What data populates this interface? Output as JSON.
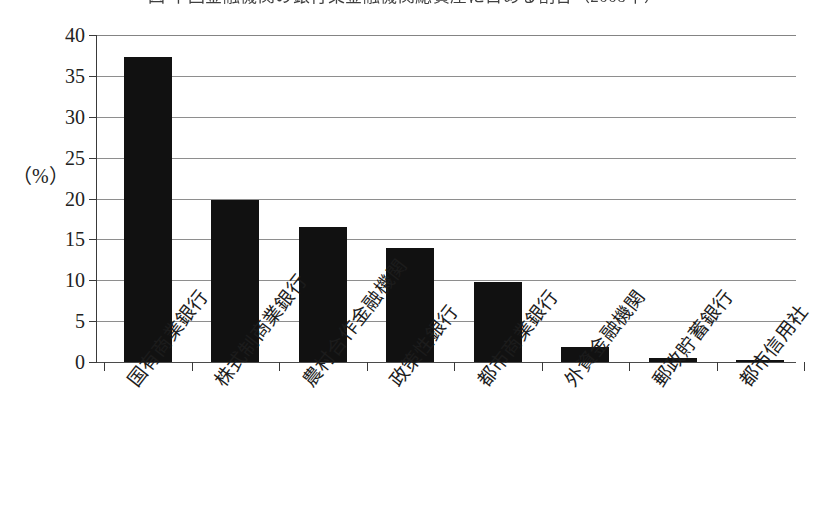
{
  "figure": {
    "title_clipped": "図 中国金融機関の銀行業金融機関総資産に占める割合（2008年）",
    "axis_unit_label": "（%）"
  },
  "chart_data": {
    "type": "bar",
    "title": "図 中国金融機関の銀行業金融機関総資産に占める割合（2008年）",
    "xlabel": "",
    "ylabel": "（%）",
    "ylim": [
      0,
      40
    ],
    "ytick_step": 5,
    "grid": true,
    "legend": "none",
    "bar_color": "#111111",
    "categories": [
      "国有商業銀行",
      "株式制商業銀行",
      "農村合作金融機関",
      "政策性銀行",
      "都市商業銀行",
      "外資金融機関",
      "郵政貯蓄銀行",
      "都市信用社"
    ],
    "values": [
      37.3,
      19.8,
      16.5,
      13.9,
      9.8,
      1.8,
      0.5,
      0.25
    ],
    "ytick_labels": [
      "0",
      "5",
      "10",
      "15",
      "20",
      "25",
      "30",
      "35",
      "40"
    ],
    "ytick_values": [
      0,
      5,
      10,
      15,
      20,
      25,
      30,
      35,
      40
    ]
  }
}
